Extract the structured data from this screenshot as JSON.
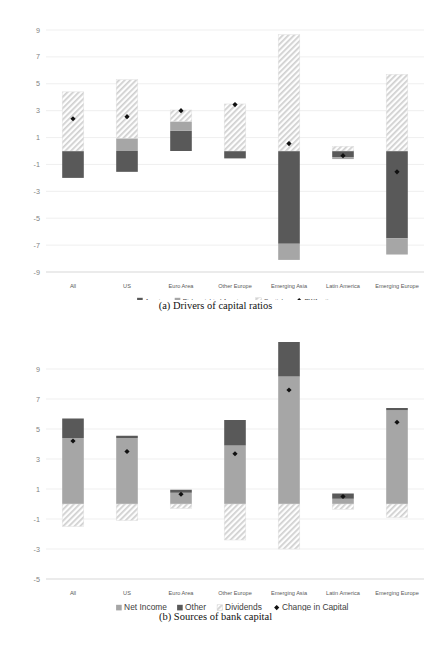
{
  "figure": {
    "panels": [
      {
        "id": "panel-a",
        "caption": "(a) Drivers of capital ratios",
        "chart_index": 0
      },
      {
        "id": "panel-b",
        "caption": "(b) Sources of bank capital",
        "chart_index": 1
      }
    ]
  },
  "chart_data": [
    {
      "type": "bar",
      "subtype": "stacked-bar-with-marker",
      "title": "(a) Drivers of capital ratios",
      "xlabel": "",
      "ylabel": "",
      "ylim": [
        -9,
        9
      ],
      "yticks": [
        9,
        7,
        5,
        3,
        1,
        -1,
        -3,
        -5,
        -7,
        -9
      ],
      "ytick_labels": [
        "9",
        "7",
        "5",
        "3",
        "1",
        "-1",
        "-3",
        "-5",
        "-7",
        "-9"
      ],
      "grid": true,
      "legend_position": "bottom",
      "categories": [
        "All",
        "US",
        "Euro Area",
        "Other Europe",
        "Emerging Asia",
        "Latin America",
        "Emerging Europe"
      ],
      "series": [
        {
          "name": "Assets",
          "key": "assets",
          "style": "solid-dark",
          "color": "#595959",
          "values": [
            -2.0,
            -1.55,
            1.5,
            -0.55,
            -6.9,
            -0.45,
            -6.5
          ]
        },
        {
          "name": "Risk-weighted Assets",
          "key": "rwa",
          "style": "solid-light",
          "color": "#a6a6a6",
          "values": [
            0.0,
            0.95,
            0.7,
            0.0,
            -1.2,
            -0.15,
            -1.2
          ]
        },
        {
          "name": "Captial",
          "key": "capital",
          "style": "hatched",
          "color": "#efefef",
          "values": [
            4.4,
            4.35,
            0.85,
            3.5,
            8.65,
            0.35,
            5.7
          ]
        }
      ],
      "marker_series": {
        "name": "RWA ratio",
        "style": "diamond",
        "color": "#111111",
        "values": [
          2.4,
          2.55,
          3.0,
          3.45,
          0.55,
          -0.35,
          -1.55
        ]
      }
    },
    {
      "type": "bar",
      "subtype": "stacked-bar-with-marker",
      "title": "(b) Sources of bank capital",
      "xlabel": "",
      "ylabel": "",
      "ylim": [
        -5,
        11
      ],
      "yticks": [
        9,
        7,
        5,
        3,
        1,
        -1,
        -3,
        -5
      ],
      "ytick_labels": [
        "9",
        "7",
        "5",
        "3",
        "1",
        "-1",
        "-3",
        "-5"
      ],
      "grid": true,
      "legend_position": "bottom",
      "categories": [
        "All",
        "US",
        "Euro Area",
        "Other Europe",
        "Emerging Asia",
        "Latin America",
        "Emerging Europe"
      ],
      "series": [
        {
          "name": "Net Income",
          "key": "net_income",
          "style": "solid-light",
          "color": "#a6a6a6",
          "values": [
            4.4,
            4.4,
            0.75,
            3.9,
            8.5,
            0.35,
            6.25
          ]
        },
        {
          "name": "Other",
          "key": "other",
          "style": "solid-dark",
          "color": "#595959",
          "values": [
            1.3,
            0.15,
            0.2,
            1.7,
            2.3,
            0.35,
            0.15
          ]
        },
        {
          "name": "Dividends",
          "key": "dividends",
          "style": "hatched",
          "color": "#efefef",
          "values": [
            -1.5,
            -1.1,
            -0.3,
            -2.4,
            -3.0,
            -0.35,
            -0.9
          ]
        }
      ],
      "marker_series": {
        "name": "Change in Capital",
        "style": "diamond",
        "color": "#111111",
        "values": [
          4.2,
          3.5,
          0.65,
          3.35,
          7.6,
          0.5,
          5.45
        ]
      }
    }
  ]
}
